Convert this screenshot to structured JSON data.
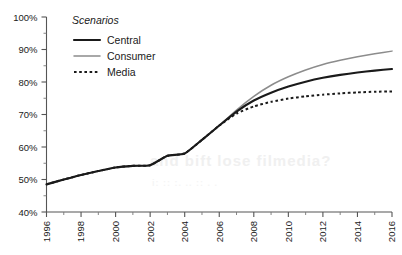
{
  "chart_data": {
    "type": "line",
    "title": "",
    "xlabel": "",
    "ylabel": "",
    "xlim": [
      1996,
      2016
    ],
    "ylim": [
      40,
      100
    ],
    "ytick_labels": [
      "40%",
      "50%",
      "60%",
      "70%",
      "80%",
      "90%",
      "100%"
    ],
    "ytick_values": [
      40,
      50,
      60,
      70,
      80,
      90,
      100
    ],
    "yminor_step": 5,
    "xtick_labels": [
      "1996",
      "1998",
      "2000",
      "2002",
      "2004",
      "2006",
      "2008",
      "2010",
      "2012",
      "2014",
      "2016"
    ],
    "xtick_values": [
      1996,
      1998,
      2000,
      2002,
      2004,
      2006,
      2008,
      2010,
      2012,
      2014,
      2016
    ],
    "xminor_step": 1,
    "grid": false,
    "legend_position": "top-left-inside",
    "legend_title": "Scenarios",
    "x": [
      1996,
      1997,
      1998,
      1999,
      2000,
      2001,
      2002,
      2003,
      2004,
      2005,
      2006,
      2007,
      2008,
      2009,
      2010,
      2011,
      2012,
      2013,
      2014,
      2015,
      2016
    ],
    "series": [
      {
        "name": "Central",
        "color": "#1a1a1a",
        "style": "solid",
        "width": 2.1,
        "values": [
          48.5,
          50.0,
          51.4,
          52.6,
          53.7,
          54.2,
          54.4,
          57.3,
          58.0,
          62.2,
          66.6,
          70.9,
          74.3,
          76.7,
          78.6,
          80.1,
          81.3,
          82.2,
          82.9,
          83.5,
          84.0
        ]
      },
      {
        "name": "Consumer",
        "color": "#8c8c8c",
        "style": "solid",
        "width": 1.5,
        "values": [
          48.5,
          50.0,
          51.4,
          52.6,
          53.7,
          54.2,
          54.4,
          57.3,
          58.0,
          62.2,
          66.6,
          71.4,
          75.6,
          79.0,
          81.6,
          83.7,
          85.4,
          86.7,
          87.8,
          88.7,
          89.5
        ]
      },
      {
        "name": "Media",
        "color": "#1a1a1a",
        "style": "dotted",
        "width": 2.0,
        "values": [
          48.5,
          50.0,
          51.4,
          52.6,
          53.7,
          54.2,
          54.4,
          57.3,
          58.0,
          62.2,
          66.6,
          70.3,
          72.5,
          73.9,
          74.9,
          75.6,
          76.1,
          76.5,
          76.8,
          77.0,
          77.1
        ]
      }
    ]
  },
  "background_artifacts": {
    "line_1": "and bift lose filmedia?",
    "line_2": "i:  ::   :.  ..   ::  .  ."
  }
}
